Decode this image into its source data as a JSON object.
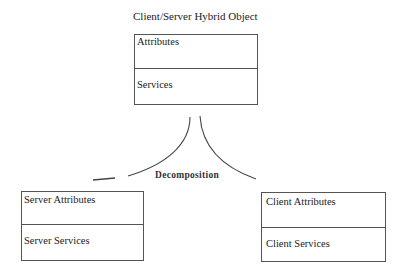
{
  "diagram": {
    "title": "Client/Server Hybrid Object",
    "hybrid_object": {
      "attributes_label": "Attributes",
      "services_label": "Services"
    },
    "relation_label": "Decomposition",
    "server_object": {
      "attributes_label": "Server Attributes",
      "services_label": "Server Services"
    },
    "client_object": {
      "attributes_label": "Client Attributes",
      "services_label": "Client Services"
    },
    "colors": {
      "line": "#555555",
      "text": "#222222",
      "background": "#ffffff"
    }
  }
}
